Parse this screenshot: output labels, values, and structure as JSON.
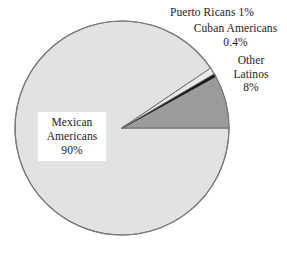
{
  "chart_data": {
    "type": "pie",
    "title": "",
    "subtitle": "",
    "xlabel": "",
    "ylabel": "",
    "legend_position": "none",
    "grid": false,
    "categories": [
      "Mexican Americans",
      "Other Latinos",
      "Cuban Americans",
      "Puerto Ricans"
    ],
    "values": [
      90,
      8,
      0.4,
      1
    ],
    "value_labels": [
      "90%",
      "8%",
      "0.4%",
      "1%"
    ],
    "units": "percent",
    "start_angle_deg": 0,
    "direction": "counterclockwise",
    "slices": [
      {
        "name": "Mexican Americans",
        "value": 90,
        "value_label": "90%",
        "color": "#e2e2e2",
        "label_lines": [
          "Mexican",
          "Americans",
          "90%"
        ],
        "label_placement": "inside-boxed"
      },
      {
        "name": "Other Latinos",
        "value": 8,
        "value_label": "8%",
        "color": "#9b9b9b",
        "label_lines": [
          "Other",
          "Latinos",
          "8%"
        ],
        "label_placement": "outside-right"
      },
      {
        "name": "Cuban Americans",
        "value": 0.4,
        "value_label": "0.4%",
        "color": "#1c1c1c",
        "label_lines": [
          "Cuban Americans",
          "0.4%"
        ],
        "label_placement": "outside-right"
      },
      {
        "name": "Puerto Ricans",
        "value": 1,
        "value_label": "1%",
        "color": "#eaeaea",
        "label_lines": [
          "Puerto Ricans 1%"
        ],
        "label_placement": "outside-top-right"
      }
    ]
  },
  "labels": {
    "puerto_ricans": "Puerto Ricans 1%",
    "cuban_americans_name": "Cuban Americans",
    "cuban_americans_value": "0.4%",
    "other_line1": "Other",
    "other_line2": "Latinos",
    "other_value": "8%",
    "mexican_line1": "Mexican",
    "mexican_line2": "Americans",
    "mexican_value": "90%"
  },
  "colors": {
    "background": "#ffffff",
    "outline": "#6f6f6f",
    "mexican_americans": "#e2e2e2",
    "other_latinos": "#9b9b9b",
    "cuban_americans": "#1c1c1c",
    "puerto_ricans": "#eaeaea",
    "text": "#1b1b1b"
  }
}
